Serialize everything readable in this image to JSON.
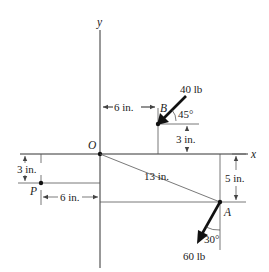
{
  "diagram": {
    "axes": {
      "x_label": "x",
      "y_label": "y"
    },
    "points": {
      "origin": "O",
      "b": "B",
      "a": "A",
      "p": "P"
    },
    "forces": {
      "b_force": "40 lb",
      "b_angle": "45°",
      "a_force": "60 lb",
      "a_angle": "30°"
    },
    "dimensions": {
      "ob_horizontal": "6 in.",
      "b_vertical": "3 in.",
      "oa_length": "13 in.",
      "a_vertical": "5 in.",
      "p_vertical": "3 in.",
      "p_horizontal": "6 in."
    }
  }
}
